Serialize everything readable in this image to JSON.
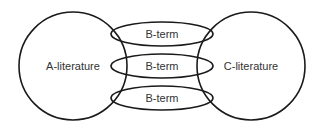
{
  "diagram": {
    "type": "literature-based-discovery",
    "circles": [
      {
        "id": "a",
        "label": "A-literature",
        "cx": 73,
        "cy": 66,
        "r": 54
      },
      {
        "id": "c",
        "label": "C-literature",
        "cx": 251,
        "cy": 66,
        "r": 54
      }
    ],
    "ellipses": [
      {
        "label": "B-term",
        "cx": 162,
        "cy": 34,
        "rx": 51,
        "ry": 12
      },
      {
        "label": "B-term",
        "cx": 162,
        "cy": 66,
        "rx": 51,
        "ry": 12
      },
      {
        "label": "B-term",
        "cx": 162,
        "cy": 98,
        "rx": 51,
        "ry": 12
      }
    ],
    "colors": {
      "stroke": "#1a1a1a",
      "text": "#333333",
      "background": "#ffffff"
    }
  }
}
